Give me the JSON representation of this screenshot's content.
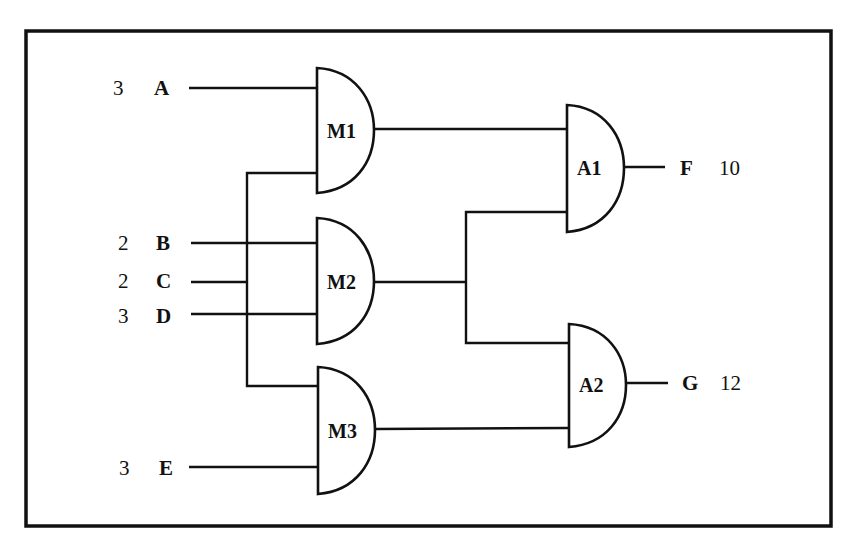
{
  "diagram": {
    "type": "combinational-circuit",
    "inputs": [
      {
        "name": "A",
        "value": "3"
      },
      {
        "name": "B",
        "value": "2"
      },
      {
        "name": "C",
        "value": "2"
      },
      {
        "name": "D",
        "value": "3"
      },
      {
        "name": "E",
        "value": "3"
      }
    ],
    "gates": [
      {
        "id": "M1",
        "label": "M1",
        "inputs": [
          "A",
          "C"
        ]
      },
      {
        "id": "M2",
        "label": "M2",
        "inputs": [
          "B",
          "D"
        ]
      },
      {
        "id": "M3",
        "label": "M3",
        "inputs": [
          "C",
          "E"
        ]
      },
      {
        "id": "A1",
        "label": "A1",
        "inputs": [
          "M1",
          "M2"
        ]
      },
      {
        "id": "A2",
        "label": "A2",
        "inputs": [
          "M2",
          "M3"
        ]
      }
    ],
    "outputs": [
      {
        "name": "F",
        "value": "10",
        "from": "A1"
      },
      {
        "name": "G",
        "value": "12",
        "from": "A2"
      }
    ]
  }
}
